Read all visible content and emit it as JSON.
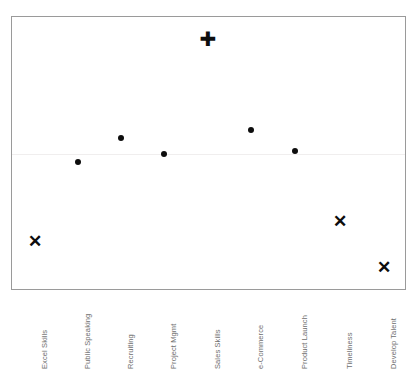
{
  "chart_data": {
    "type": "scatter",
    "title": "",
    "xlabel": "",
    "ylabel": "",
    "grid": false,
    "legend": "none",
    "reference_line_y": 0,
    "ylim": [
      -1.6,
      1.6
    ],
    "categories": [
      "Excel Skills",
      "Public Speaking",
      "Recruiting",
      "Project Mgmt",
      "Sales Skills",
      "e-Commerce",
      "Product Launch",
      "Timeliness",
      "Develop Talent"
    ],
    "points": [
      {
        "category": "Excel Skills",
        "value": -0.98,
        "marker": "cross",
        "x_px": 34,
        "y_px": 240
      },
      {
        "category": "Public Speaking",
        "value": 0.1,
        "marker": "dot",
        "x_px": 77,
        "y_px": 161
      },
      {
        "category": "Recruiting",
        "value": 0.32,
        "marker": "dot",
        "x_px": 120,
        "y_px": 137
      },
      {
        "category": "Project Mgmt",
        "value": 0.17,
        "marker": "dot",
        "x_px": 163,
        "y_px": 153
      },
      {
        "category": "Sales Skills",
        "value": 1.46,
        "marker": "plus",
        "x_px": 207,
        "y_px": 38
      },
      {
        "category": "e-Commerce",
        "value": 0.4,
        "marker": "dot",
        "x_px": 250,
        "y_px": 129
      },
      {
        "category": "Product Launch",
        "value": 0.2,
        "marker": "dot",
        "x_px": 294,
        "y_px": 150
      },
      {
        "category": "Timeliness",
        "value": -0.75,
        "marker": "cross",
        "x_px": 339,
        "y_px": 220
      },
      {
        "category": "Develop Talent",
        "value": -1.26,
        "marker": "cross",
        "x_px": 383,
        "y_px": 266
      }
    ],
    "marker_glyphs": {
      "dot": "",
      "plus": "✚",
      "cross": "✕"
    },
    "colors": {
      "marker": "#0d0d0d",
      "frame": "#9a9a9a",
      "reference_line": "#f0eeee",
      "label_text": "#6e6e6e",
      "background": "#ffffff"
    }
  }
}
